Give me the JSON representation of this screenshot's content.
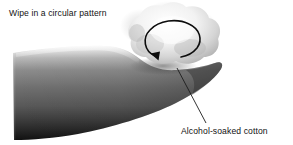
{
  "figure": {
    "width": 293,
    "height": 145,
    "background_color": "#ffffff",
    "title": "Wipe in a circular pattern",
    "medium": "grayscale halftone medical illustration"
  },
  "labels": {
    "top_caption": "Wipe in a circular pattern",
    "bottom_caption": "Alcohol-soaked cotton"
  },
  "colors": {
    "text": "#121212",
    "line": "#1c1c1c",
    "arrow": "#0d0d0d",
    "skin_light": "#d8d8d8",
    "skin_mid": "#6d6d6d",
    "skin_dark": "#1f1f1f",
    "skin_darkest": "#111111",
    "cotton_light": "#f4f4f4",
    "cotton_mid": "#cfcfcf",
    "cotton_shadow": "#9a9a9a",
    "background": "#ffffff"
  },
  "elements": {
    "arm": {
      "name": "forearm-finger",
      "description": "tapered limb running from left edge to rounded tip at right",
      "tone": "dark gray gradient, lighter along upper edge"
    },
    "cotton_ball": {
      "name": "alcohol-soaked-cotton",
      "description": "fluffy light cloud resting on the upper surface near the tip",
      "tone": "near-white with soft gray fluff edges"
    },
    "circular_arrow": {
      "name": "circular-motion-arrow",
      "description": "open circular arc with solid triangular arrowhead",
      "direction": "clockwise",
      "gap_position": "bottom-right",
      "arrowhead_at": "lower-left"
    },
    "leader_line": {
      "name": "leader-line",
      "description": "thin diagonal line from cotton ball down-right to the bottom caption",
      "from": [
        177,
        68
      ],
      "to": [
        206,
        123
      ]
    }
  }
}
